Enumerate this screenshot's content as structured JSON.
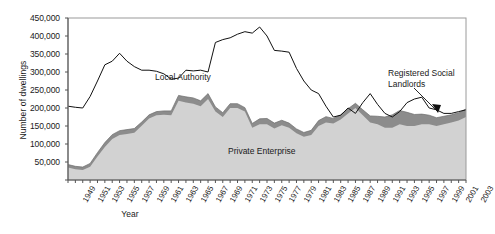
{
  "chart_data": {
    "type": "area",
    "title": "",
    "xlabel": "Year",
    "ylabel": "Number of dwellings",
    "xlim": [
      1949,
      2003
    ],
    "ylim": [
      0,
      450000
    ],
    "ytick_labels": [
      "450,000",
      "400,000",
      "350,000",
      "300,000",
      "250,000",
      "200,000",
      "150,000",
      "100,000",
      "50,000"
    ],
    "ytick_values": [
      450000,
      400000,
      350000,
      300000,
      250000,
      200000,
      150000,
      100000,
      50000
    ],
    "xtick_labels": [
      "1949",
      "1951",
      "1953",
      "1955",
      "1957",
      "1959",
      "1961",
      "1963",
      "1965",
      "1967",
      "1969",
      "1971",
      "1973",
      "1975",
      "1977",
      "1979",
      "1981",
      "1983",
      "1985",
      "1987",
      "1989",
      "1991",
      "1993",
      "1995",
      "1997",
      "1999",
      "2001",
      "2003"
    ],
    "grid": false,
    "legend_position": "in-plot annotations",
    "x": [
      1949,
      1950,
      1951,
      1952,
      1953,
      1954,
      1955,
      1956,
      1957,
      1958,
      1959,
      1960,
      1961,
      1962,
      1963,
      1964,
      1965,
      1966,
      1967,
      1968,
      1969,
      1970,
      1971,
      1972,
      1973,
      1974,
      1975,
      1976,
      1977,
      1978,
      1979,
      1980,
      1981,
      1982,
      1983,
      1984,
      1985,
      1986,
      1987,
      1988,
      1989,
      1990,
      1991,
      1992,
      1993,
      1994,
      1995,
      1996,
      1997,
      1998,
      1999,
      2000,
      2001,
      2002,
      2003
    ],
    "series": [
      {
        "name": "Private Enterprise",
        "color": "#d2d2d2",
        "stacked": true,
        "values": [
          35000,
          30000,
          28000,
          37000,
          65000,
          92000,
          114000,
          125000,
          128000,
          131000,
          151000,
          171000,
          180000,
          181000,
          180000,
          220000,
          215000,
          212000,
          205000,
          225000,
          190000,
          175000,
          200000,
          200000,
          190000,
          145000,
          155000,
          155000,
          143000,
          152000,
          145000,
          130000,
          120000,
          125000,
          150000,
          160000,
          157000,
          168000,
          185000,
          200000,
          180000,
          160000,
          155000,
          145000,
          145000,
          155000,
          150000,
          150000,
          155000,
          155000,
          150000,
          155000,
          160000,
          165000,
          175000
        ]
      },
      {
        "name": "Registered Social Landlords",
        "color": "#8c8c8c",
        "stacked": true,
        "values": [
          8000,
          8000,
          8000,
          9000,
          11000,
          12000,
          12000,
          12000,
          12000,
          12000,
          10000,
          10000,
          10000,
          11000,
          12000,
          15000,
          16000,
          16000,
          15000,
          15000,
          13000,
          12000,
          12000,
          12000,
          11000,
          12000,
          15000,
          16000,
          15000,
          14000,
          13000,
          12000,
          12000,
          13000,
          15000,
          16000,
          14000,
          13000,
          13000,
          13000,
          15000,
          18000,
          22000,
          30000,
          36000,
          38000,
          38000,
          32000,
          28000,
          25000,
          23000,
          22000,
          21000,
          22000,
          22000
        ]
      },
      {
        "name": "Local Authority",
        "color": "#000000",
        "stacked": false,
        "line_only": true,
        "values": [
          205000,
          202000,
          200000,
          232000,
          275000,
          320000,
          330000,
          352000,
          330000,
          315000,
          305000,
          305000,
          302000,
          295000,
          280000,
          283000,
          305000,
          303000,
          305000,
          300000,
          382000,
          390000,
          395000,
          405000,
          412000,
          408000,
          425000,
          400000,
          360000,
          358000,
          355000,
          310000,
          275000,
          250000,
          240000,
          205000,
          175000,
          180000,
          200000,
          185000,
          215000,
          240000,
          210000,
          185000,
          175000,
          190000,
          215000,
          225000,
          230000,
          200000,
          195000,
          185000,
          185000,
          190000,
          195000
        ]
      }
    ],
    "annotations": [
      {
        "name": "local-authority-label",
        "text": "Local Authority"
      },
      {
        "name": "private-enterprise-label",
        "text": "Private Enterprise"
      },
      {
        "name": "registered-social-landlords-label",
        "text": "Registered Social Landlords"
      }
    ]
  },
  "labels": {
    "ylabel": "Number of dwellings",
    "xlabel": "Year",
    "local_authority": "Local Authority",
    "private_enterprise": "Private Enterprise",
    "registered_social_landlords": "Registered Social Landlords"
  }
}
